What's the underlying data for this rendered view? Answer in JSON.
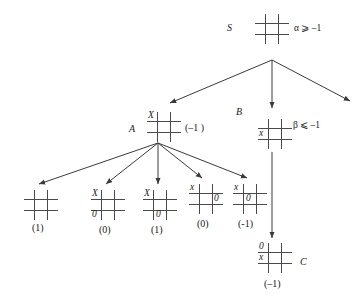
{
  "diagram": {
    "line_color": "#4a4a4a",
    "text_color": "#1a1a1a"
  },
  "nodes": {
    "root": {
      "label": "S",
      "bound": "α ⩾ –1",
      "marks": []
    },
    "a": {
      "label": "A",
      "value": "(–1 )",
      "marks": [
        {
          "cell": "r0c0",
          "text": "X"
        }
      ]
    },
    "b": {
      "label": "B",
      "bound": "β ⩽ –1",
      "marks": [
        {
          "cell": "r1c0",
          "text": "x"
        }
      ]
    },
    "c": {
      "label": "C",
      "value": "(–1)",
      "marks": [
        {
          "cell": "r0c0",
          "text": "0"
        },
        {
          "cell": "r1c0",
          "text": "x"
        }
      ]
    }
  },
  "leaves": [
    {
      "name": "leaf-1",
      "value": "(1)",
      "marks": []
    },
    {
      "name": "leaf-2",
      "value": "(0)",
      "marks": [
        {
          "cell": "r0c0",
          "text": "X"
        },
        {
          "cell": "r2c0",
          "text": "0"
        }
      ]
    },
    {
      "name": "leaf-3",
      "value": "(1)",
      "marks": [
        {
          "cell": "r0c0",
          "text": "X"
        },
        {
          "cell": "r2c1",
          "text": "0"
        }
      ]
    },
    {
      "name": "leaf-4",
      "value": "(0)",
      "marks": [
        {
          "cell": "r0c0",
          "text": "x"
        },
        {
          "cell": "r1c2",
          "text": "0"
        }
      ]
    },
    {
      "name": "leaf-5",
      "value": "(-1)",
      "marks": [
        {
          "cell": "r0c0",
          "text": "x"
        },
        {
          "cell": "r1c1",
          "text": "0"
        }
      ]
    }
  ]
}
